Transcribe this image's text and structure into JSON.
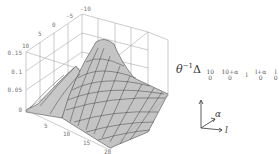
{
  "figure": {
    "type": "3d-surface",
    "z_axis_ticks": [
      "0",
      "0.05",
      "0.1",
      "0.15"
    ],
    "left_axis_ticks": [
      "0",
      "5",
      "10"
    ],
    "back_axis_ticks": [
      "-10",
      "-5",
      "0",
      "5",
      "10"
    ],
    "front_axis_ticks": [
      "5",
      "10",
      "15",
      "20"
    ],
    "surface_color": "#c8c8c8",
    "mesh_color": "#333333",
    "box_color": "#aaaaaa"
  },
  "formula": {
    "prefix": "θ",
    "exponent": "−1",
    "operator": "Δ",
    "subscripts": [
      {
        "top": "10",
        "bottom": "0"
      },
      {
        "top": "10+α",
        "bottom": "0"
      },
      {
        "top": "l",
        "bottom": ""
      },
      {
        "top": "l+α",
        "bottom": "0"
      },
      {
        "top": "l",
        "bottom": "0"
      }
    ]
  },
  "axes_indicator": {
    "alpha_label": "α",
    "l_label": "l"
  }
}
